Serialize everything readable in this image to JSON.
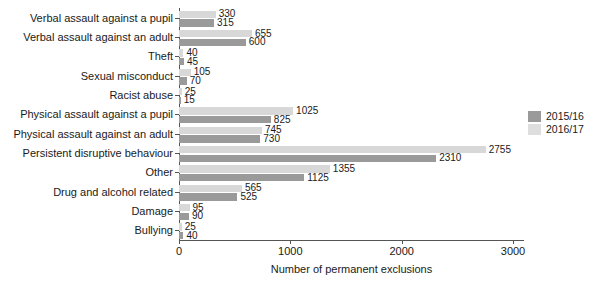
{
  "chart_data": {
    "type": "bar",
    "orientation": "horizontal",
    "title": "",
    "xlabel": "Number of permanent exclusions",
    "ylabel": "",
    "xlim": [
      0,
      3000
    ],
    "xticks": [
      0,
      1000,
      2000,
      3000
    ],
    "xticklabels": [
      "0",
      "1000",
      "2000",
      "3000"
    ],
    "grid": false,
    "legend_position": "right",
    "categories": [
      "Verbal assault against a pupil",
      "Verbal assault against an adult",
      "Theft",
      "Sexual misconduct",
      "Racist abuse",
      "Physical assault against a pupil",
      "Physical assault against an adult",
      "Persistent disruptive behaviour",
      "Other",
      "Drug and alcohol related",
      "Damage",
      "Bullying"
    ],
    "series": [
      {
        "name": "2015/16",
        "color": "#9a9a9a",
        "values": [
          315,
          600,
          45,
          70,
          15,
          825,
          730,
          2310,
          1125,
          525,
          90,
          40
        ]
      },
      {
        "name": "2016/17",
        "color": "#d8d8d8",
        "values": [
          330,
          655,
          40,
          105,
          25,
          1025,
          745,
          2755,
          1355,
          565,
          95,
          25
        ]
      }
    ]
  }
}
